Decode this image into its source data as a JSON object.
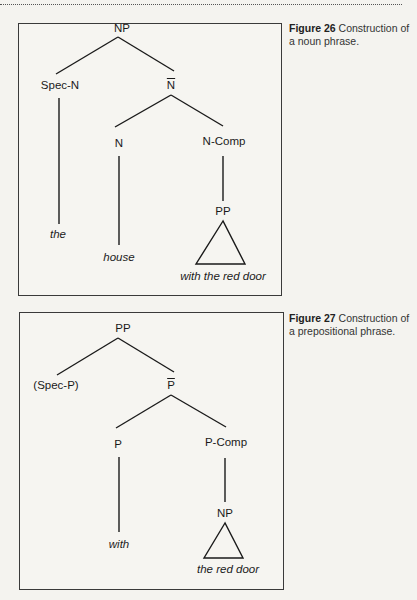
{
  "page": {
    "figures": [
      {
        "id": "fig26",
        "caption_number": "Figure 26",
        "caption_text": "Construction of a noun phrase.",
        "tree": {
          "root": "NP",
          "spec": "Spec-N",
          "bar": "N",
          "head": "N",
          "comp": "N-Comp",
          "comp_phrase": "PP",
          "spec_word": "the",
          "head_word": "house",
          "comp_words": "with the red door"
        }
      },
      {
        "id": "fig27",
        "caption_number": "Figure 27",
        "caption_text": "Construction of a prepositional phrase.",
        "tree": {
          "root": "PP",
          "spec": "(Spec-P)",
          "bar": "P",
          "head": "P",
          "comp": "P-Comp",
          "comp_phrase": "NP",
          "head_word": "with",
          "comp_words": "the red door"
        }
      }
    ]
  }
}
